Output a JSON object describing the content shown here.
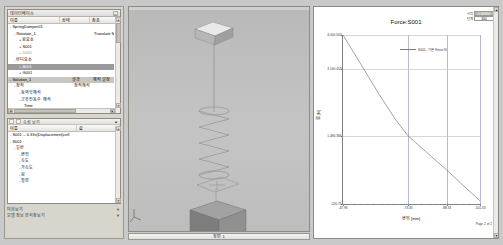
{
  "left_dock": {
    "database_panel": {
      "title": "데이터베이스",
      "close_label": "×",
      "columns": [
        "이름",
        "상태",
        "참조"
      ],
      "rows": [
        {
          "name": "SpringDamper01",
          "indent": 0,
          "twig": "-",
          "c2": "",
          "c3": ""
        },
        {
          "name": "Rotation_1",
          "indent": 1,
          "twig": "-",
          "c2": "",
          "c3": "Translate Motion"
        },
        {
          "name": "힘요소",
          "indent": 2,
          "twig": "+",
          "c2": "",
          "c3": ""
        },
        {
          "name": "S001",
          "indent": 2,
          "twig": "+",
          "c2": "",
          "c3": ""
        },
        {
          "name": "D001",
          "indent": 2,
          "twig": "+",
          "c2": "",
          "c3": "",
          "dim": true
        },
        {
          "name": "바디요소",
          "indent": 1,
          "twig": "-",
          "c2": "",
          "c3": ""
        },
        {
          "name": "B001",
          "indent": 2,
          "twig": "+",
          "c2": "",
          "c3": "",
          "selected": true
        },
        {
          "name": "G001",
          "indent": 2,
          "twig": "+",
          "c2": "",
          "c3": ""
        },
        {
          "name": "Solution_1",
          "indent": 0,
          "twig": "-",
          "c2": "결과",
          "c3": "해석 설정",
          "selected2": true
        },
        {
          "name": "정적",
          "indent": 1,
          "twig": "-",
          "c2": "정적해석",
          "c3": ""
        },
        {
          "name": "동역학해석",
          "indent": 2,
          "twig": "-",
          "c2": "",
          "c3": ""
        },
        {
          "name": "고유진동수 해석",
          "indent": 2,
          "twig": "-",
          "c2": "",
          "c3": ""
        },
        {
          "name": "Time",
          "indent": 3,
          "twig": "",
          "c2": "",
          "c3": ""
        },
        {
          "name": "S001 -- 0.33s...",
          "indent": 3,
          "twig": "-",
          "c2": "",
          "c3": ""
        },
        {
          "name": "결과_001",
          "indent": 3,
          "twig": "-",
          "c2": "",
          "c3": ""
        }
      ],
      "hscroll_thumb_pct": 62,
      "scroll_up_icon": "▲",
      "scroll_down_icon": "▼",
      "scroll_left_icon": "◄",
      "scroll_right_icon": "►"
    },
    "properties_panel": {
      "toolbar": {
        "label": "속성 보기",
        "pin_icon": "▲",
        "buttons": [
          "grid-icon",
          "list-icon",
          "sort-icon"
        ]
      },
      "columns": [
        "이름",
        "값"
      ],
      "rows": [
        {
          "name": "S001 -- 0.33s(Displacement)cell",
          "indent": 0,
          "twig": "-",
          "value": ""
        },
        {
          "name": "S001",
          "indent": 0,
          "twig": "-",
          "value": ""
        },
        {
          "name": "일반",
          "indent": 1,
          "twig": "-",
          "value": ""
        },
        {
          "name": "변위",
          "indent": 2,
          "twig": "-",
          "value": ""
        },
        {
          "name": "속도",
          "indent": 2,
          "twig": "-",
          "value": ""
        },
        {
          "name": "가속도",
          "indent": 2,
          "twig": "-",
          "value": ""
        },
        {
          "name": "힘",
          "indent": 2,
          "twig": "-",
          "value": ""
        },
        {
          "name": "질량",
          "indent": 2,
          "twig": "-",
          "value": ""
        }
      ],
      "scroll_up_icon": "▲",
      "scroll_down_icon": "▼"
    },
    "footer": {
      "line1": "미리보기",
      "line2": "모델 정보 분석창보기",
      "chevron1": "▼",
      "chevron2": "▼"
    }
  },
  "viewport": {
    "status_text": "정면 1",
    "axis_icon": "axis-triad-icon"
  },
  "chart": {
    "tools": {
      "row1_label": "시작",
      "row1_value": "0.00000",
      "row2_label": "단계",
      "row2_value": "300"
    },
    "page_label": "Page 2 of 2"
  },
  "chart_data": {
    "type": "line",
    "title": "Force:S001",
    "xlabel": "변위 [mm]",
    "ylabel": "힘 [N]",
    "xlim": [
      -47.96,
      -101.33
    ],
    "ylim": [
      -220.75,
      4000.003
    ],
    "xticks": [
      -47.96,
      -73.33,
      -88.33,
      -101.33
    ],
    "xticklabels": [
      "-47.96",
      "-73.33",
      "-88.33",
      "-101.33"
    ],
    "yticks": [
      -220.75,
      1480.366,
      3140.453,
      4000.003
    ],
    "yticklabels": [
      "-220.75",
      "1.480.366",
      "3.140.453",
      "4.000.003"
    ],
    "grid": true,
    "legend_position": "top-right",
    "series": [
      {
        "name": "S001 - 기본:Force:N",
        "color": "#7a7a7a",
        "x": [
          -47.96,
          -55.0,
          -62.0,
          -68.5,
          -73.33,
          -80.0,
          -88.33,
          -95.0,
          -101.33
        ],
        "y": [
          4000.0,
          3260.0,
          2520.0,
          1880.0,
          1480.4,
          1100.0,
          630.0,
          230.0,
          -140.0
        ]
      }
    ]
  }
}
